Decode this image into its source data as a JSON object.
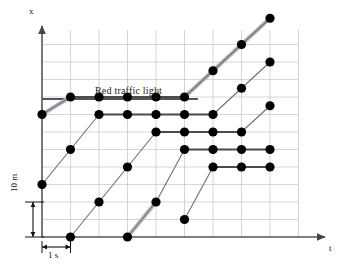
{
  "figure": {
    "type": "position-time-diagram",
    "title": "",
    "background": "#ffffff"
  },
  "axes": {
    "x_axis_label": "t",
    "y_axis_label": "x",
    "origin_px": {
      "x": 42,
      "y": 237
    },
    "x_axis_end_px": 330,
    "y_axis_top_px": 22,
    "axis_color": "#555555",
    "grid_color": "#c9c9d6",
    "grid_columns": 9,
    "grid_rows": 11,
    "grid_step_x_px": 28.5,
    "grid_step_y_px": 17.5,
    "grid_on": true
  },
  "scale_bars": {
    "horizontal": {
      "label": "1 s",
      "value": 1,
      "unit": "s",
      "grid_columns_spanned": 1,
      "x_start_px": 42,
      "x_end_px": 70.5,
      "y_px": 247
    },
    "vertical": {
      "label": "10 m",
      "value": 10,
      "unit": "m",
      "grid_rows_spanned": 2,
      "y_top_px": 202,
      "y_bottom_px": 237,
      "x_px": 27
    }
  },
  "annotations": {
    "traffic_light": {
      "label": "Red traffic light",
      "line_color": "#555555",
      "line_y_px": 99,
      "line_x_start_px": 42,
      "line_x_end_px": 198,
      "text_x_px": 95,
      "text_y_px": 85,
      "meaning": "Red phase duration and stop-line position"
    }
  },
  "style": {
    "dot_color": "#000000",
    "dot_radius_px": 4.6,
    "trajectory_color": "#6e6e78",
    "trajectory_width_px": 1.1,
    "plateau_color": "#4a4a52",
    "plateau_width_px": 1.8,
    "highlight_color": "#b8b8bd",
    "highlight_width_px": 4.2
  },
  "chart_data": {
    "type": "line",
    "title": "",
    "xlabel": "t",
    "ylabel": "x",
    "grid": true,
    "legend": false,
    "x_unit": "s",
    "y_unit": "m",
    "x_per_grid": 1,
    "y_per_grid": 5,
    "xlim": [
      0,
      9
    ],
    "ylim": [
      0,
      11
    ],
    "series": [
      {
        "name": "car-1",
        "x": [
          0,
          1,
          2,
          3,
          4,
          5,
          6,
          7,
          8
        ],
        "y": [
          7,
          8,
          8,
          8,
          8,
          8,
          9.5,
          11,
          12.5
        ],
        "stopped_from_x": 2,
        "stopped_until_x": 5,
        "highlighted_segments": [
          [
            0,
            1
          ],
          [
            5,
            8
          ]
        ]
      },
      {
        "name": "car-2",
        "x": [
          0,
          1,
          2,
          3,
          4,
          5,
          6,
          7,
          8
        ],
        "y": [
          3,
          5,
          7,
          7,
          7,
          7,
          7,
          8.5,
          10
        ],
        "stopped_from_x": 2,
        "stopped_until_x": 6,
        "highlighted_segments": []
      },
      {
        "name": "car-3",
        "x": [
          1,
          2,
          3,
          4,
          5,
          6,
          7,
          8
        ],
        "y": [
          0,
          2,
          4,
          6,
          6,
          6,
          6,
          7.5
        ],
        "stopped_from_x": 4,
        "stopped_until_x": 7,
        "highlighted_segments": []
      },
      {
        "name": "car-4",
        "x": [
          3,
          4,
          5,
          6,
          7,
          8
        ],
        "y": [
          0,
          2,
          5,
          5,
          5,
          5
        ],
        "stopped_from_x": 5,
        "stopped_until_x": 8,
        "highlighted_segments": [
          [
            3,
            4
          ]
        ]
      },
      {
        "name": "car-5",
        "x": [
          5,
          6,
          7,
          8
        ],
        "y": [
          1,
          4,
          4,
          4
        ],
        "stopped_from_x": 6,
        "stopped_until_x": 8,
        "highlighted_segments": []
      }
    ],
    "data_points_count": 38
  }
}
